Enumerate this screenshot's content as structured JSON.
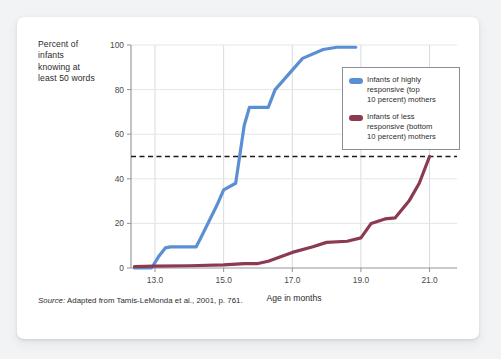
{
  "card": {
    "background_color": "#ffffff",
    "page_background_color": "#f2f3f5"
  },
  "ylabel_block": {
    "line1": "Percent of",
    "line2": "infants",
    "line3": "knowing at",
    "line4": "least 50 words"
  },
  "legend": {
    "series": [
      {
        "swatch_color": "#5B8FD4",
        "line1": "Infants of highly",
        "line2": "responsive (top",
        "line3": "10 percent) mothers"
      },
      {
        "swatch_color": "#8B3A50",
        "line1": "Infants of less",
        "line2": "responsive (bottom",
        "line3": "10 percent) mothers"
      }
    ]
  },
  "source_note": {
    "lead": "Source:",
    "text": " Adapted from Tamis-LeMonda et al., 2001, p. 761."
  },
  "chart_data": {
    "type": "line",
    "title": "",
    "xlabel": "Age in months",
    "ylabel": "Percent of infants knowing at least 50 words",
    "xlim": [
      12.3,
      21.8
    ],
    "ylim": [
      0,
      100
    ],
    "xticks": [
      13.0,
      15.0,
      17.0,
      19.0,
      21.0
    ],
    "xtick_labels": [
      "13.0",
      "15.0",
      "17.0",
      "19.0",
      "21.0"
    ],
    "yticks": [
      0,
      20,
      40,
      60,
      80,
      100
    ],
    "ytick_labels": [
      "0",
      "20",
      "40",
      "60",
      "80",
      "100"
    ],
    "grid": true,
    "legend_position": "upper right inside",
    "reference_line": {
      "value": 50,
      "style": "dashed",
      "color": "#1a1a1a",
      "orientation": "horizontal"
    },
    "series": [
      {
        "name": "Infants of highly responsive (top 10 percent) mothers",
        "color": "#5B8FD4",
        "x": [
          12.4,
          12.9,
          13.1,
          13.3,
          13.45,
          14.2,
          14.35,
          14.8,
          15.0,
          15.35,
          15.6,
          15.75,
          16.3,
          16.5,
          17.3,
          17.9,
          18.3,
          18.85
        ],
        "y": [
          0,
          0,
          5,
          9,
          9.5,
          9.5,
          14,
          28,
          35,
          38,
          64,
          72,
          72,
          80,
          94,
          98,
          99,
          99
        ]
      },
      {
        "name": "Infants of less responsive (bottom 10 percent) mothers",
        "color": "#8B3A50",
        "x": [
          12.4,
          13.0,
          14.0,
          15.0,
          15.6,
          16.0,
          16.3,
          17.0,
          17.6,
          18.0,
          18.6,
          19.0,
          19.3,
          19.7,
          20.0,
          20.4,
          20.7,
          21.0
        ],
        "y": [
          0.6,
          0.8,
          1.0,
          1.4,
          2.0,
          2.0,
          3.0,
          7.0,
          9.5,
          11.5,
          12.0,
          13.5,
          20.0,
          22.0,
          22.5,
          30.0,
          38.0,
          50.0
        ]
      }
    ]
  }
}
